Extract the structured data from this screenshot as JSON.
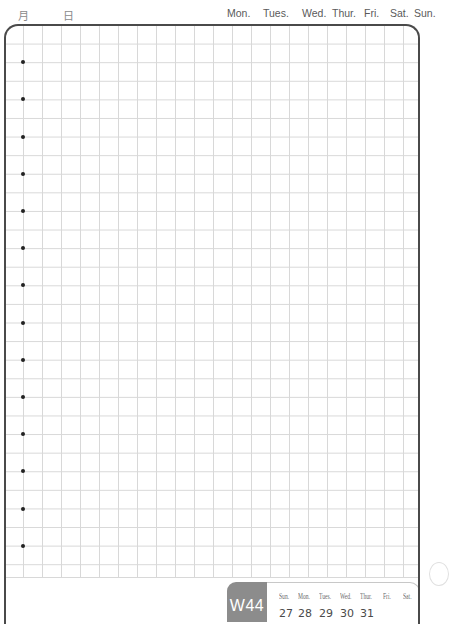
{
  "header": {
    "month_label": "月",
    "day_label": "日",
    "weekdays": [
      "Mon.",
      "Tues.",
      "Wed.",
      "Thur.",
      "Fri.",
      "Sat.",
      "Sun."
    ]
  },
  "page": {
    "grid": {
      "columns": 22,
      "rows": 30,
      "line_color": "#d8d8d8",
      "border_color": "#4a4a4a"
    },
    "bullet_count": 14
  },
  "footer": {
    "week_label": "W44",
    "week_badge_color": "#8c8c8c",
    "mini_calendar": {
      "days": [
        "Sun.",
        "Mon.",
        "Tues.",
        "Wed.",
        "Thur.",
        "Fri.",
        "Sat."
      ],
      "dates": [
        "27",
        "28",
        "29",
        "30",
        "31",
        "",
        ""
      ]
    }
  }
}
